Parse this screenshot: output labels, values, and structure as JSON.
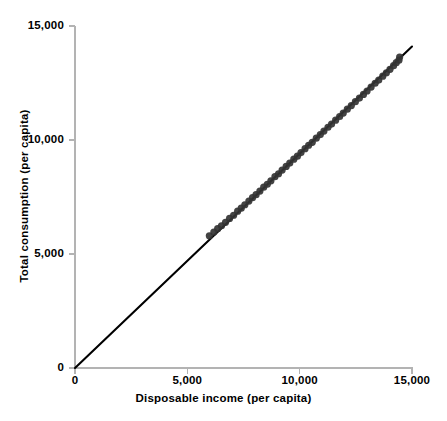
{
  "chart_data": {
    "type": "scatter",
    "title": "",
    "xlabel": "Disposable income (per capita)",
    "ylabel": "Total consumption (per capita)",
    "xlim": [
      0,
      15000
    ],
    "ylim": [
      0,
      15000
    ],
    "xticks": [
      "0",
      "5,000",
      "10,000",
      "15,000"
    ],
    "xtick_values": [
      0,
      5000,
      10000,
      15000
    ],
    "yticks": [
      "0",
      "5,000",
      "10,000",
      "15,000"
    ],
    "ytick_values": [
      0,
      5000,
      10000,
      15000
    ],
    "grid": false,
    "legend": "none",
    "marker_color": "#333333",
    "line_color": "#000000",
    "axis_color": "#b3b3b3",
    "reference_line": {
      "name": "45-degree line",
      "x": [
        0,
        15000
      ],
      "y": [
        0,
        14100
      ]
    },
    "series": [
      {
        "name": "Consumption vs disposable income",
        "points": [
          [
            5980,
            5800
          ],
          [
            6180,
            5960
          ],
          [
            6350,
            6110
          ],
          [
            6520,
            6240
          ],
          [
            6700,
            6390
          ],
          [
            6880,
            6560
          ],
          [
            7060,
            6700
          ],
          [
            7240,
            6880
          ],
          [
            7400,
            7010
          ],
          [
            7560,
            7160
          ],
          [
            7740,
            7320
          ],
          [
            7900,
            7470
          ],
          [
            8060,
            7600
          ],
          [
            8230,
            7760
          ],
          [
            8400,
            7930
          ],
          [
            8560,
            8060
          ],
          [
            8720,
            8210
          ],
          [
            8900,
            8390
          ],
          [
            9060,
            8520
          ],
          [
            9220,
            8680
          ],
          [
            9400,
            8840
          ],
          [
            9560,
            8990
          ],
          [
            9740,
            9160
          ],
          [
            9900,
            9290
          ],
          [
            10060,
            9450
          ],
          [
            10240,
            9620
          ],
          [
            10400,
            9770
          ],
          [
            10560,
            9900
          ],
          [
            10740,
            10080
          ],
          [
            10920,
            10240
          ],
          [
            11080,
            10390
          ],
          [
            11260,
            10560
          ],
          [
            11420,
            10700
          ],
          [
            11600,
            10870
          ],
          [
            11780,
            11030
          ],
          [
            11940,
            11180
          ],
          [
            12120,
            11350
          ],
          [
            12300,
            11510
          ],
          [
            12480,
            11680
          ],
          [
            12660,
            11840
          ],
          [
            12840,
            12000
          ],
          [
            13000,
            12150
          ],
          [
            13180,
            12320
          ],
          [
            13360,
            12490
          ],
          [
            13520,
            12630
          ],
          [
            13700,
            12800
          ],
          [
            13860,
            12950
          ],
          [
            14020,
            13100
          ],
          [
            14180,
            13260
          ],
          [
            14300,
            13390
          ],
          [
            14420,
            13500
          ],
          [
            14450,
            13640
          ]
        ]
      }
    ]
  }
}
